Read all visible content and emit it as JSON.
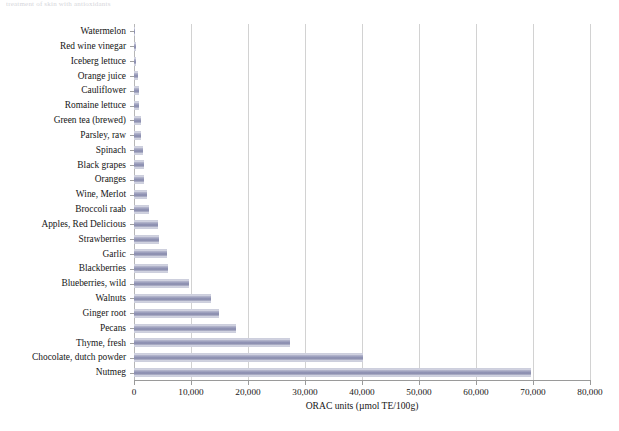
{
  "page_header": {
    "text": "treatment of skin with antioxidants"
  },
  "chart_data": {
    "type": "bar",
    "orientation": "horizontal",
    "title": "",
    "xlabel": "ORAC units (µmol TE/100g)",
    "ylabel": "",
    "xlim": [
      0,
      80000
    ],
    "xticks": [
      0,
      10000,
      20000,
      30000,
      40000,
      50000,
      60000,
      70000,
      80000
    ],
    "xtick_labels": [
      "0",
      "10,000",
      "20,000",
      "30,000",
      "40,000",
      "50,000",
      "60,000",
      "70,000",
      "80,000"
    ],
    "grid": "vertical",
    "legend": "none",
    "bar_color": "#9093b4",
    "categories": [
      "Watermelon",
      "Red wine vinegar",
      "Iceberg lettuce",
      "Orange juice",
      "Cauliflower",
      "Romaine lettuce",
      "Green tea (brewed)",
      "Parsley, raw",
      "Spinach",
      "Black grapes",
      "Oranges",
      "Wine, Merlot",
      "Broccoli raab",
      "Apples, Red Delicious",
      "Strawberries",
      "Garlic",
      "Blackberries",
      "Blueberries, wild",
      "Walnuts",
      "Ginger root",
      "Pecans",
      "Thyme, fresh",
      "Chocolate, dutch powder",
      "Nutmeg"
    ],
    "values": [
      142,
      410,
      438,
      726,
      870,
      963,
      1253,
      1301,
      1513,
      1789,
      1819,
      2340,
      2710,
      4275,
      4302,
      5708,
      5905,
      9621,
      13541,
      14840,
      17940,
      27426,
      40200,
      69640
    ]
  }
}
